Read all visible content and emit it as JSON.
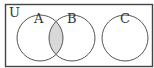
{
  "diagram": {
    "type": "venn",
    "universe_label": "U",
    "sets": [
      {
        "label": "A"
      },
      {
        "label": "B"
      },
      {
        "label": "C"
      }
    ],
    "shaded_region": "A ∩ B",
    "colors": {
      "stroke": "#444444",
      "shade": "#d8d8d8",
      "background": "#ffffff"
    }
  }
}
